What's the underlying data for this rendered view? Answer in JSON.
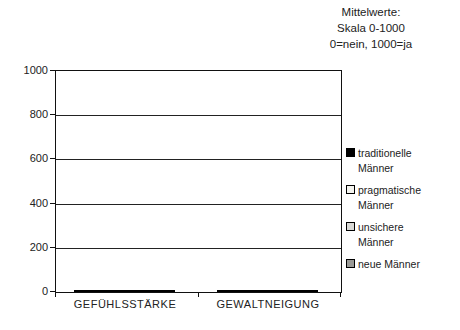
{
  "note": {
    "line1": "Mittelwerte:",
    "line2": "Skala 0-1000",
    "line3": "0=nein, 1000=ja"
  },
  "chart_data": {
    "type": "bar",
    "title": "",
    "annotation": "Mittelwerte: Skala 0-1000, 0=nein, 1000=ja",
    "categories": [
      "GEFÜHLSSTÄRKE",
      "GEWALTNEIGUNG"
    ],
    "series": [
      {
        "name": "traditionelle Männer",
        "color": "#000000",
        "values": [
          555,
          430
        ]
      },
      {
        "name": "pragmatische Männer",
        "color": "#f4f4ef",
        "values": [
          540,
          375
        ]
      },
      {
        "name": "unsichere Männer",
        "color": "#d9d9d6",
        "values": [
          585,
          290
        ]
      },
      {
        "name": "neue Männer",
        "color": "#9a9a96",
        "values": [
          605,
          170
        ]
      }
    ],
    "ylim": [
      0,
      1000
    ],
    "yticks": [
      0,
      200,
      400,
      600,
      800,
      1000
    ],
    "grid": true,
    "legend_position": "right",
    "xlabel": "",
    "ylabel": ""
  }
}
